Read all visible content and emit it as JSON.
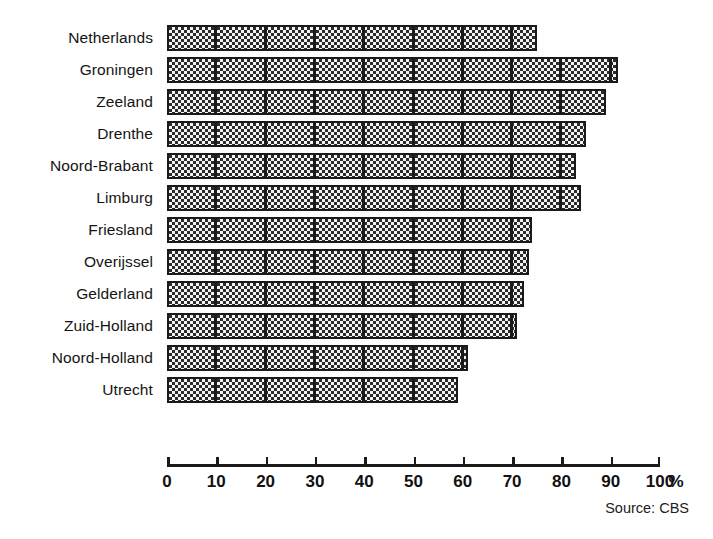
{
  "chart_data": {
    "type": "bar",
    "orientation": "horizontal",
    "title": "",
    "subtitle": "",
    "xlabel": "%",
    "ylabel": "",
    "xlim": [
      0,
      100
    ],
    "grid": false,
    "legend": null,
    "source_note": "Source: CBS",
    "axis_unit": "%",
    "tick_labels": [
      "0",
      "10",
      "20",
      "30",
      "40",
      "50",
      "60",
      "70",
      "80",
      "90",
      "100"
    ],
    "tick_values": [
      0,
      10,
      20,
      30,
      40,
      50,
      60,
      70,
      80,
      90,
      100
    ],
    "categories": [
      "Netherlands",
      "Groningen",
      "Zeeland",
      "Drenthe",
      "Noord-Brabant",
      "Limburg",
      "Friesland",
      "Overijssel",
      "Gelderland",
      "Zuid-Holland",
      "Noord-Holland",
      "Utrecht"
    ],
    "values": [
      75,
      91.5,
      89,
      85,
      83,
      84,
      74,
      73.5,
      72.5,
      71,
      61,
      59
    ],
    "bar_fill": "#7d7d7d",
    "bar_outline": "#1a1a1a",
    "segment_interval": 10
  }
}
